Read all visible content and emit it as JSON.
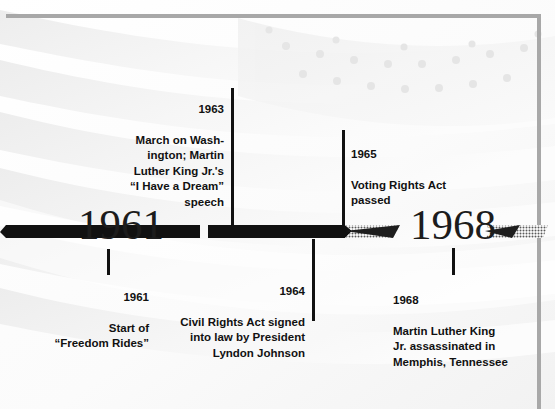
{
  "poster": {
    "background_image": "american-flag-watermark",
    "frame_color": "#a8a8a8",
    "bar_color": "#111111",
    "text_color": "#111111"
  },
  "timeline": {
    "axis_years": [
      {
        "label": "1961",
        "name": "year-marker-1961"
      },
      {
        "label": "1968",
        "name": "year-marker-1968"
      }
    ],
    "events": [
      {
        "id": "event-1963",
        "year": "1963",
        "description": "March on Wash-\\nington; Martin\\nLuther King Jr.'s\\n“I Have a Dream”\\nspeech",
        "side": "above",
        "align": "right"
      },
      {
        "id": "event-1965",
        "year": "1965",
        "description": "Voting Rights Act\\npassed",
        "side": "above",
        "align": "left"
      },
      {
        "id": "event-1961",
        "year": "1961",
        "description": "Start of\\n“Freedom Rides”",
        "side": "below",
        "align": "right"
      },
      {
        "id": "event-1964",
        "year": "1964",
        "description": "Civil Rights Act signed\\ninto law by President\\nLyndon Johnson",
        "side": "below",
        "align": "right"
      },
      {
        "id": "event-1968",
        "year": "1968",
        "description": "Martin Luther King\\nJr. assassinated in\\nMemphis, Tennessee",
        "side": "below",
        "align": "left"
      }
    ]
  }
}
